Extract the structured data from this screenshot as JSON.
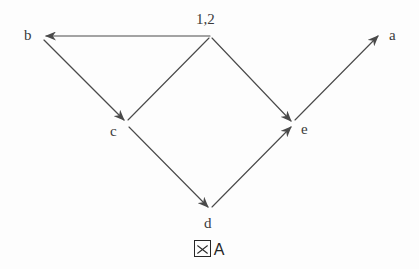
{
  "figure": {
    "caption_glyph": "figure-box-glyph",
    "caption_text": "A",
    "caption_full": "図 A",
    "background_color": "#fdfdfd",
    "stroke_color": "#4a4a4a"
  },
  "nodes": [
    {
      "id": "top",
      "label": "1,2",
      "x": 210,
      "y": 36,
      "label_x": 196,
      "label_y": 12
    },
    {
      "id": "b",
      "label": "b",
      "x": 42,
      "y": 36,
      "label_x": 24,
      "label_y": 28
    },
    {
      "id": "a",
      "label": "a",
      "x": 380,
      "y": 35,
      "label_x": 389,
      "label_y": 28
    },
    {
      "id": "c",
      "label": "c",
      "x": 126,
      "y": 124,
      "label_x": 110,
      "label_y": 124
    },
    {
      "id": "e",
      "label": "e",
      "x": 293,
      "y": 124,
      "label_x": 301,
      "label_y": 122
    },
    {
      "id": "d",
      "label": "d",
      "x": 210,
      "y": 210,
      "label_x": 204,
      "label_y": 216
    }
  ],
  "edges": [
    {
      "id": "top-to-b",
      "from": "top",
      "to": "b",
      "arrow": "at-target",
      "x1": 210,
      "y1": 36,
      "x2": 46,
      "y2": 36
    },
    {
      "id": "b-to-c",
      "from": "b",
      "to": "c",
      "arrow": "at-target",
      "x1": 44,
      "y1": 40,
      "x2": 124,
      "y2": 120
    },
    {
      "id": "c-to-top",
      "from": "c",
      "to": "top",
      "arrow": "none",
      "x1": 128,
      "y1": 120,
      "x2": 209,
      "y2": 38
    },
    {
      "id": "top-to-e",
      "from": "top",
      "to": "e",
      "arrow": "at-target",
      "x1": 212,
      "y1": 38,
      "x2": 291,
      "y2": 121
    },
    {
      "id": "c-to-d",
      "from": "c",
      "to": "d",
      "arrow": "at-target",
      "x1": 129,
      "y1": 127,
      "x2": 208,
      "y2": 207
    },
    {
      "id": "d-to-e",
      "from": "d",
      "to": "e",
      "arrow": "at-target",
      "x1": 212,
      "y1": 207,
      "x2": 291,
      "y2": 127
    },
    {
      "id": "e-to-a",
      "from": "e",
      "to": "a",
      "arrow": "at-target",
      "x1": 295,
      "y1": 120,
      "x2": 378,
      "y2": 36
    }
  ]
}
